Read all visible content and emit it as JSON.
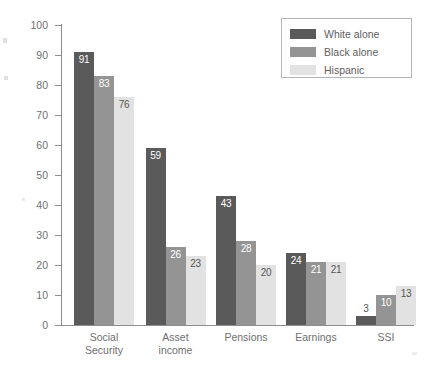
{
  "chart_data": {
    "type": "bar",
    "title": "",
    "xlabel": "",
    "ylabel": "Percent",
    "ylim": [
      0,
      100
    ],
    "yticks": [
      0,
      10,
      20,
      30,
      40,
      50,
      60,
      70,
      80,
      90,
      100
    ],
    "grid": false,
    "legend_position": "top-right",
    "categories": [
      "Social Security",
      "Asset income",
      "Pensions",
      "Earnings",
      "SSI"
    ],
    "category_lines": [
      [
        "Social",
        "Security"
      ],
      [
        "Asset",
        "income"
      ],
      [
        "Pensions"
      ],
      [
        "Earnings"
      ],
      [
        "SSI"
      ]
    ],
    "series": [
      {
        "name": "White alone",
        "color": "#5a5a5a",
        "label_color": "#ffffff",
        "values": [
          91,
          59,
          43,
          24,
          3
        ]
      },
      {
        "name": "Black alone",
        "color": "#949494",
        "label_color": "#ffffff",
        "values": [
          83,
          26,
          28,
          21,
          10
        ]
      },
      {
        "name": "Hispanic",
        "color": "#e2e2e2",
        "label_color": "#555555",
        "values": [
          76,
          23,
          20,
          21,
          13
        ]
      }
    ]
  },
  "axis": {
    "y_label": "Percent",
    "y_tick_labels": [
      "100",
      "90",
      "80",
      "70",
      "60",
      "50",
      "40",
      "30",
      "20",
      "10",
      "0"
    ]
  },
  "legend": {
    "items": [
      {
        "label": "White alone",
        "color": "#5a5a5a"
      },
      {
        "label": "Black alone",
        "color": "#949494"
      },
      {
        "label": "Hispanic",
        "color": "#e2e2e2"
      }
    ]
  }
}
